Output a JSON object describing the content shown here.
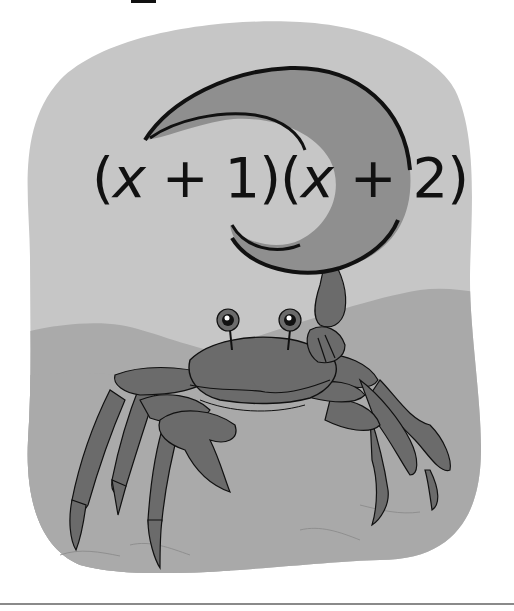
{
  "illustration": {
    "subject": "crab with raised claw",
    "expression": {
      "open1": "(",
      "var1": "x",
      "rest1": " + 1)(",
      "var2": "x",
      "rest2": " + 2)"
    },
    "colors": {
      "background": "#c6c6c6",
      "hills": "#a9a9a9",
      "claw": "#8f8f8f",
      "body": "#6b6b6b",
      "outline": "#111111"
    }
  }
}
